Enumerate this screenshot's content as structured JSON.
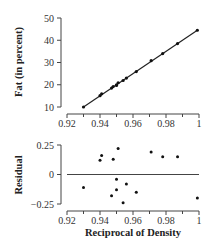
{
  "chart_data": [
    {
      "type": "scatter",
      "title": "",
      "xlabel": "",
      "ylabel": "Fat (in percent)",
      "xlim": [
        0.92,
        1.0
      ],
      "ylim": [
        10,
        50
      ],
      "xticks": [
        "0.92",
        "0.94",
        "0.96",
        "0.98",
        "1"
      ],
      "yticks": [
        "10",
        "20",
        "30",
        "40",
        "50"
      ],
      "grid": false,
      "fit_line": {
        "x": [
          0.93,
          0.999
        ],
        "y": [
          10,
          44.5
        ]
      },
      "series": [
        {
          "name": "Fat vs Reciprocal of Density",
          "x": [
            0.93,
            0.94,
            0.941,
            0.947,
            0.948,
            0.95,
            0.95,
            0.951,
            0.954,
            0.956,
            0.962,
            0.971,
            0.978,
            0.987,
            0.999
          ],
          "y": [
            10.0,
            15.1,
            15.9,
            18.5,
            19.2,
            19.7,
            20.0,
            20.9,
            21.9,
            23.0,
            25.9,
            30.8,
            34.0,
            38.5,
            44.5
          ]
        }
      ]
    },
    {
      "type": "scatter",
      "title": "",
      "xlabel": "Reciprocal of Density",
      "ylabel": "Residual",
      "xlim": [
        0.92,
        1.0
      ],
      "ylim": [
        -0.25,
        0.25
      ],
      "xticks": [
        "0.92",
        "0.94",
        "0.96",
        "0.98",
        "1"
      ],
      "yticks": [
        "0.25",
        "0",
        "-0.25"
      ],
      "grid": false,
      "reference_line": 0,
      "series": [
        {
          "name": "Residuals",
          "x": [
            0.93,
            0.94,
            0.941,
            0.947,
            0.948,
            0.95,
            0.95,
            0.951,
            0.954,
            0.956,
            0.962,
            0.971,
            0.978,
            0.987,
            0.999
          ],
          "y": [
            -0.11,
            0.12,
            0.16,
            -0.18,
            0.13,
            -0.04,
            -0.13,
            0.22,
            -0.24,
            -0.08,
            -0.15,
            0.19,
            0.15,
            0.15,
            -0.2
          ]
        }
      ]
    }
  ]
}
